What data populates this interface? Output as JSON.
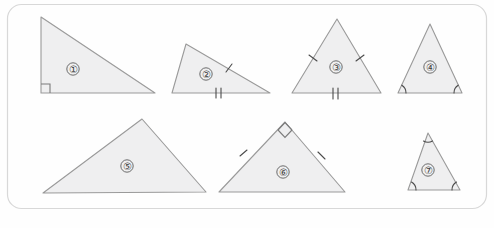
{
  "page": {
    "background_color": "#fefefe",
    "card_border_color": "#d8d8d8",
    "shape_fill_color": "#efeff0",
    "shape_stroke_color": "#9a9a9a",
    "mark_color": "#4a4a4a",
    "width": 494,
    "height": 228
  },
  "card": {
    "name": "rounded-panel",
    "x": 7,
    "y": 4,
    "width": 480,
    "height": 205,
    "corner_radius": 14
  },
  "figures": [
    {
      "id": 1,
      "label": "①",
      "label_x": 73,
      "label_y": 69,
      "points": "41,17 41,93 155,93",
      "marks": {
        "right_angle": [
          {
            "vertex": "bottom-left",
            "x": 41,
            "y": 93
          }
        ],
        "side_ticks": [],
        "angle_arcs": []
      },
      "description": "right triangle, vertical left leg, right angle at lower-left"
    },
    {
      "id": 2,
      "label": "②",
      "label_x": 206,
      "label_y": 74,
      "points": "186,44 270,93 172,93",
      "marks": {
        "right_angle": [],
        "side_ticks": [
          {
            "side": "right-slant",
            "count": 1,
            "x": 229,
            "y": 68
          },
          {
            "side": "base",
            "count": 2,
            "x": 219,
            "y": 93
          }
        ],
        "angle_arcs": []
      },
      "description": "scalene triangle with one tick on right side and two ticks on base"
    },
    {
      "id": 3,
      "label": "③",
      "label_x": 336,
      "label_y": 67,
      "points": "337,19 381,93 292,93",
      "marks": {
        "right_angle": [],
        "side_ticks": [
          {
            "side": "left-slant",
            "count": 1,
            "x": 313,
            "y": 58
          },
          {
            "side": "right-slant",
            "count": 1,
            "x": 360,
            "y": 58
          },
          {
            "side": "base",
            "count": 2,
            "x": 336,
            "y": 93
          }
        ],
        "angle_arcs": []
      },
      "description": "equilateral-looking triangle, single tick on each slanted side and double tick on base"
    },
    {
      "id": 4,
      "label": "④",
      "label_x": 430,
      "label_y": 67,
      "points": "430,24 462,93 398,93",
      "marks": {
        "right_angle": [],
        "side_ticks": [],
        "angle_arcs": [
          {
            "vertex": "bottom-left",
            "x": 398,
            "y": 93
          },
          {
            "vertex": "bottom-right",
            "x": 462,
            "y": 93
          }
        ]
      },
      "description": "isosceles triangle with equal base angles marked"
    },
    {
      "id": 5,
      "label": "⑤",
      "label_x": 127,
      "label_y": 166,
      "points": "142,119 206,192 43,193",
      "marks": {
        "right_angle": [],
        "side_ticks": [],
        "angle_arcs": []
      },
      "description": "scalene triangle with no markings"
    },
    {
      "id": 6,
      "label": "⑥",
      "label_x": 283,
      "label_y": 172,
      "points": "285,122 345,192 219,192",
      "marks": {
        "right_angle": [
          {
            "vertex": "apex",
            "x": 285,
            "y": 122
          }
        ],
        "side_ticks": [
          {
            "side": "left-slant",
            "count": 1,
            "x": 243,
            "y": 153
          },
          {
            "side": "right-slant",
            "count": 1,
            "x": 321,
            "y": 156
          }
        ],
        "angle_arcs": []
      },
      "description": "right isosceles triangle, right angle at apex, one tick on each slant side"
    },
    {
      "id": 7,
      "label": "⑦",
      "label_x": 428,
      "label_y": 170,
      "points": "428,133 460,190 408,190",
      "marks": {
        "right_angle": [],
        "side_ticks": [],
        "angle_arcs": [
          {
            "vertex": "apex",
            "x": 428,
            "y": 133
          },
          {
            "vertex": "bottom-left",
            "x": 408,
            "y": 190
          },
          {
            "vertex": "bottom-right",
            "x": 460,
            "y": 190
          }
        ]
      },
      "description": "triangle with all three angles marked"
    }
  ]
}
